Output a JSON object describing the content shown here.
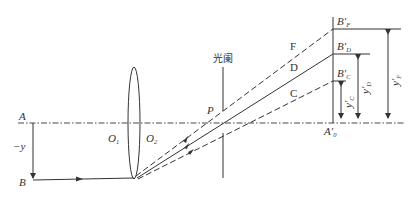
{
  "diagram": {
    "type": "optical-ray-diagram",
    "colors": {
      "line": "#333333",
      "background": "#ffffff"
    },
    "labels": {
      "object_axis_point": "A",
      "object_point": "B",
      "object_height": "−y",
      "lens_vertex_1": "O",
      "lens_vertex_1_sub": "1",
      "lens_vertex_2": "O",
      "lens_vertex_2_sub": "2",
      "stop_center": "P",
      "stop_label": "光阑",
      "ray_F": "F",
      "ray_D": "D",
      "ray_C": "C",
      "image_axis_point": "A′",
      "image_axis_point_sub": "0",
      "image_F": "B′",
      "image_F_sub": "F",
      "image_D": "B′",
      "image_D_sub": "D",
      "image_C": "B′",
      "image_C_sub": "C",
      "height_C": "y′",
      "height_C_sub": "C",
      "height_D": "y′",
      "height_D_sub": "D",
      "height_F": "y′",
      "height_F_sub": "F"
    },
    "rays": [
      {
        "name": "F",
        "style": "dashed"
      },
      {
        "name": "D",
        "style": "solid"
      },
      {
        "name": "C",
        "style": "dashed"
      }
    ]
  }
}
